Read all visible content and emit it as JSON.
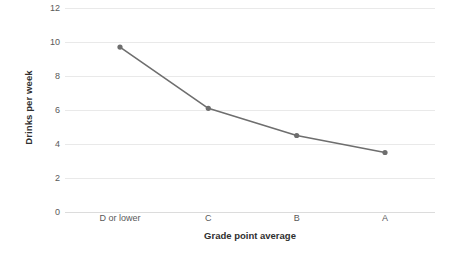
{
  "chart_data": {
    "type": "line",
    "title": "",
    "xlabel": "Grade point average",
    "ylabel": "Drinks per week",
    "categories": [
      "D or lower",
      "C",
      "B",
      "A"
    ],
    "values": [
      9.7,
      6.1,
      4.5,
      3.5
    ],
    "series": [
      {
        "name": "Drinks per week",
        "values": [
          9.7,
          6.1,
          4.5,
          3.5
        ]
      }
    ],
    "ylim": [
      0,
      12
    ],
    "yticks": [
      0,
      2,
      4,
      6,
      8,
      10,
      12
    ],
    "ytick_labels": [
      "0",
      "2",
      "4",
      "6",
      "8",
      "10",
      "12"
    ],
    "grid": true,
    "grid_axis": "y",
    "legend": false,
    "legend_position": "none",
    "marker": "circle",
    "line_color": "#6e6e6e",
    "marker_color": "#6e6e6e",
    "grid_color": "#e9e9e9",
    "text_color": "#595959"
  }
}
